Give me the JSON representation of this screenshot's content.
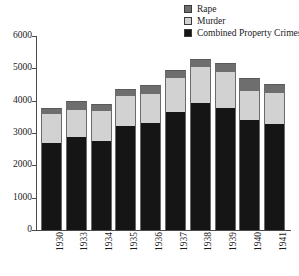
{
  "chart_data": {
    "type": "bar",
    "subtype": "stacked-vertical",
    "title": "",
    "xlabel": "",
    "ylabel": "",
    "ylim": [
      0,
      6000
    ],
    "yticks": [
      0,
      1000,
      2000,
      3000,
      4000,
      5000,
      6000
    ],
    "ytick_labels": [
      "0",
      "1000",
      "2000",
      "3000",
      "4000",
      "5000",
      "6000"
    ],
    "grid": false,
    "legend_position": "top-right",
    "categories": [
      "1930",
      "1933",
      "1934",
      "1935",
      "1936",
      "1937",
      "1938",
      "1939",
      "1940",
      "1941"
    ],
    "series": [
      {
        "name": "Combined Property Crimes",
        "color": "#151515",
        "values": [
          2700,
          2880,
          2740,
          3210,
          3310,
          3650,
          3920,
          3780,
          3390,
          3280
        ]
      },
      {
        "name": "Murder",
        "color": "#d2d2d2",
        "values": [
          900,
          830,
          950,
          950,
          900,
          1060,
          1130,
          1100,
          910,
          950
        ]
      },
      {
        "name": "Rape",
        "color": "#6e6e6e",
        "values": [
          180,
          290,
          210,
          200,
          290,
          230,
          250,
          280,
          390,
          280
        ]
      }
    ],
    "totals": [
      3780,
      4000,
      3900,
      4360,
      4500,
      4940,
      5300,
      5160,
      4690,
      4510
    ]
  },
  "legend": {
    "items": [
      {
        "label": "Rape",
        "color": "#6e6e6e"
      },
      {
        "label": "Murder",
        "color": "#d2d2d2"
      },
      {
        "label": "Combined Property Crimes",
        "color": "#151515"
      }
    ]
  },
  "axes": {
    "y": {
      "ticks": [
        "6000",
        "5000",
        "4000",
        "3000",
        "2000",
        "1000",
        "0"
      ]
    },
    "x": {
      "ticks": [
        "1930",
        "1933",
        "1934",
        "1935",
        "1936",
        "1937",
        "1938",
        "1939",
        "1940",
        "1941"
      ]
    }
  }
}
